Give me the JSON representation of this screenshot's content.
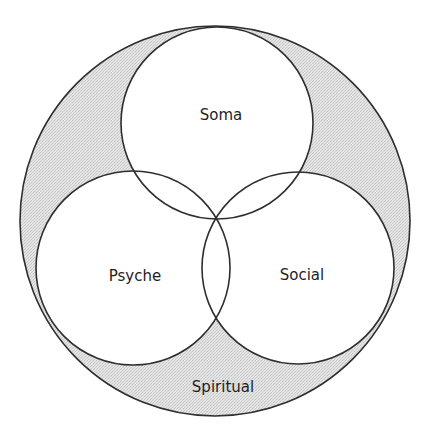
{
  "diagram": {
    "type": "venn",
    "outer": {
      "label": "Spiritual",
      "cx": 215,
      "cy": 221,
      "r": 195,
      "label_x": 223,
      "label_y": 387
    },
    "circles": [
      {
        "id": "soma",
        "label": "Soma",
        "cx": 217,
        "cy": 123,
        "r": 96,
        "label_x": 221,
        "label_y": 115
      },
      {
        "id": "psyche",
        "label": "Psyche",
        "cx": 133,
        "cy": 268,
        "r": 97,
        "label_x": 135,
        "label_y": 276
      },
      {
        "id": "social",
        "label": "Social",
        "cx": 298,
        "cy": 268,
        "r": 96,
        "label_x": 302,
        "label_y": 275
      }
    ],
    "colors": {
      "ring_fill": "#dcdcdc",
      "stroke": "#2e2e2e",
      "inner_fill": "#ffffff"
    }
  }
}
